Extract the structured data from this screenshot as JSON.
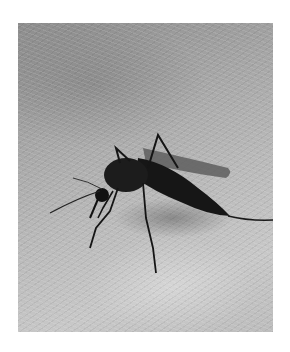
{
  "image": {
    "subject": "mosquito feeding on human skin",
    "style": "grayscale photograph",
    "alt": "Close-up black and white photograph of a mosquito biting skin",
    "colors": {
      "background_margin": "#ffffff",
      "skin_light": "#c8c8c8",
      "skin_dark": "#8d8d8d",
      "mosquito_body": "#1a1a1a",
      "wing": "#5a5a5a"
    }
  }
}
